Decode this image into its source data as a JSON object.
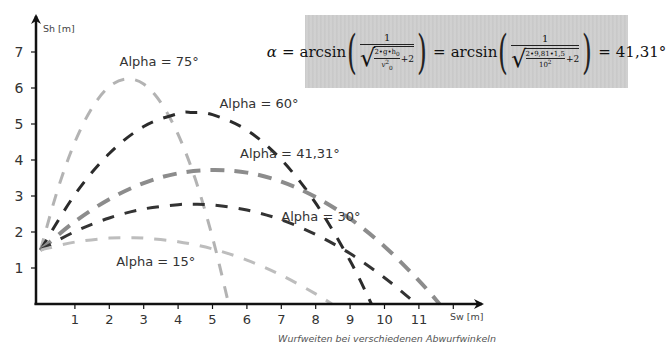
{
  "chart_data": {
    "type": "line",
    "title": "",
    "caption": "Wurfweiten bei verschiedenen Abwurfwinkeln",
    "xlabel": "Sw [m]",
    "ylabel": "Sh [m]",
    "xlim": [
      0,
      12.5
    ],
    "ylim": [
      0,
      7.5
    ],
    "xticks": [
      1,
      2,
      3,
      4,
      5,
      6,
      7,
      8,
      9,
      10,
      11
    ],
    "yticks": [
      1,
      2,
      3,
      4,
      5,
      6,
      7
    ],
    "grid": false,
    "legend": "inline labels",
    "line_style": "dashed",
    "series": [
      {
        "name": "Alpha = 75°",
        "color": "#b3b3b3",
        "width": 3,
        "label_pos": [
          2.3,
          6.6
        ],
        "x": [
          0,
          0.5,
          1,
          1.5,
          2,
          2.5,
          3,
          3.5,
          4,
          4.5,
          5,
          5.47
        ],
        "y": [
          1.5,
          3.18,
          4.5,
          5.45,
          6.04,
          6.25,
          6.11,
          5.59,
          4.71,
          3.47,
          1.85,
          0
        ]
      },
      {
        "name": "Alpha = 60°",
        "color": "#2b2b2b",
        "width": 3,
        "label_pos": [
          5.2,
          5.45
        ],
        "x": [
          0,
          1,
          2,
          3,
          4,
          4.41,
          5,
          6,
          7,
          8,
          9,
          9.62
        ],
        "y": [
          1.5,
          3.04,
          4.18,
          4.93,
          5.29,
          5.32,
          5.26,
          4.83,
          4.01,
          2.8,
          1.2,
          0
        ]
      },
      {
        "name": "Alpha = 41,31°",
        "color": "#8c8c8c",
        "width": 4,
        "label_pos": [
          5.8,
          4.05
        ],
        "x": [
          0,
          1,
          2,
          3,
          4,
          5,
          6,
          7,
          8,
          9,
          10,
          11,
          11.6
        ],
        "y": [
          1.5,
          2.29,
          2.91,
          3.36,
          3.63,
          3.72,
          3.65,
          3.4,
          2.97,
          2.37,
          1.6,
          0.65,
          0
        ]
      },
      {
        "name": "Alpha = 30°",
        "color": "#333333",
        "width": 3,
        "label_pos": [
          7.0,
          2.3
        ],
        "x": [
          0,
          1,
          2,
          3,
          4,
          4.41,
          5,
          6,
          7,
          8,
          9,
          10,
          10.93
        ],
        "y": [
          1.5,
          2.01,
          2.39,
          2.64,
          2.76,
          2.77,
          2.75,
          2.61,
          2.34,
          1.93,
          1.4,
          0.73,
          0
        ]
      },
      {
        "name": "Alpha = 15°",
        "color": "#bdbdbd",
        "width": 3,
        "label_pos": [
          2.2,
          1.05
        ],
        "x": [
          0,
          1,
          2,
          2.55,
          3,
          4,
          5,
          6,
          7,
          8,
          8.47
        ],
        "y": [
          1.5,
          1.72,
          1.83,
          1.84,
          1.83,
          1.73,
          1.53,
          1.22,
          0.8,
          0.28,
          0
        ]
      }
    ],
    "annotations": [
      "α = arcsin(1/√(2·g·h0/v0² + 2)) = arcsin(1/√(2·9,81·1,5/10² + 2)) = 41,31°"
    ]
  },
  "formula": {
    "alpha": "α",
    "eq": "=",
    "arcsin": "arcsin",
    "one": "1",
    "sym_num": "2•g•h",
    "sym_sub": "0",
    "sym_den": "v",
    "sym_den_sup": "2",
    "sym_den_sub": "0",
    "plus2": "+2",
    "num_num": "2•9,81•1,5",
    "num_den": "10",
    "num_den_sup": "2",
    "result": "41,31°"
  }
}
